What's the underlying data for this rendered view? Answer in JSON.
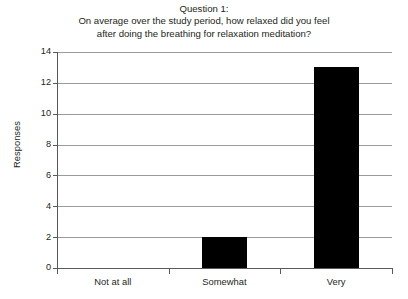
{
  "chart_data": {
    "type": "bar",
    "title_lines": [
      "Question 1:",
      "On average over the study period, how relaxed did you feel",
      "after doing the breathing for relaxation meditation?"
    ],
    "title": "Question 1: On average over the study period, how relaxed did you feel after doing the breathing for relaxation meditation?",
    "categories": [
      "Not at all",
      "Somewhat",
      "Very"
    ],
    "values": [
      0,
      2,
      13
    ],
    "xlabel": "",
    "ylabel": "Responses",
    "ylim": [
      0,
      14
    ],
    "ytick_labels": [
      "0",
      "2",
      "4",
      "6",
      "8",
      "10",
      "12",
      "14"
    ],
    "ytick_values": [
      0,
      2,
      4,
      6,
      8,
      10,
      12,
      14
    ],
    "grid": true,
    "legend": "none",
    "bar_color": "#000000",
    "gridline_color": "#9a9a9a",
    "axis_color": "#58595b",
    "background_color": "#ffffff"
  }
}
